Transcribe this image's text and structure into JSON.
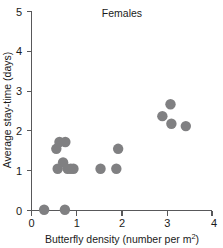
{
  "chart_data": {
    "type": "scatter",
    "title": "Females",
    "xlabel": "Butterfly density (number per m2)",
    "xlabel_main": "Butterfly density (number per m",
    "xlabel_sup": "2",
    "xlabel_tail": ")",
    "ylabel": "Average stay-time (days)",
    "xlim": [
      0,
      4
    ],
    "ylim": [
      0,
      5
    ],
    "xticks": [
      0,
      1,
      2,
      3,
      4
    ],
    "xtick_labels": [
      "0",
      "1",
      "2",
      "3",
      "4"
    ],
    "yticks": [
      0,
      1,
      2,
      3,
      4,
      5
    ],
    "ytick_labels": [
      "0",
      "1",
      "2",
      "3",
      "4",
      "5"
    ],
    "grid": false,
    "legend": false,
    "marker": "circle",
    "marker_color": "#808082",
    "marker_size": 5.2,
    "axis_color": "#58585a",
    "background": "#ffffff",
    "n_points": 16,
    "points": [
      {
        "x": 0.28,
        "y": 0.02
      },
      {
        "x": 0.74,
        "y": 0.02
      },
      {
        "x": 0.55,
        "y": 1.55
      },
      {
        "x": 0.62,
        "y": 1.72
      },
      {
        "x": 0.75,
        "y": 1.72
      },
      {
        "x": 0.58,
        "y": 1.05
      },
      {
        "x": 0.7,
        "y": 1.21
      },
      {
        "x": 0.8,
        "y": 1.05
      },
      {
        "x": 0.87,
        "y": 1.05
      },
      {
        "x": 0.93,
        "y": 1.05
      },
      {
        "x": 1.53,
        "y": 1.05
      },
      {
        "x": 1.88,
        "y": 1.05
      },
      {
        "x": 1.92,
        "y": 1.55
      },
      {
        "x": 2.9,
        "y": 2.37
      },
      {
        "x": 3.08,
        "y": 2.67
      },
      {
        "x": 3.1,
        "y": 2.18
      },
      {
        "x": 3.42,
        "y": 2.12
      }
    ],
    "x": [
      0.28,
      0.74,
      0.55,
      0.62,
      0.75,
      0.58,
      0.7,
      0.8,
      0.87,
      0.93,
      1.53,
      1.88,
      1.92,
      2.9,
      3.08,
      3.1,
      3.42
    ],
    "values": [
      0.02,
      0.02,
      1.55,
      1.72,
      1.72,
      1.05,
      1.21,
      1.05,
      1.05,
      1.05,
      1.05,
      1.05,
      1.55,
      2.37,
      2.67,
      2.18,
      2.12
    ]
  }
}
